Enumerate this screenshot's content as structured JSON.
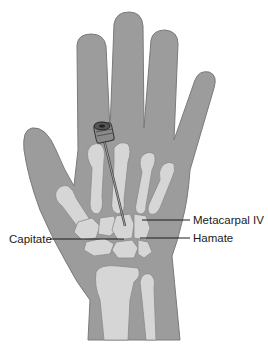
{
  "figure": {
    "colors": {
      "background": "#ffffff",
      "skin": "#9c9c9c",
      "skin_outline": "#7a7a7a",
      "bone": "#d6d6d6",
      "bone_outline": "#8a8a8a",
      "needle": "#444444",
      "leader_line": "#1a1a1a"
    },
    "labels": {
      "metacarpal_iv": "Metacarpal IV",
      "capitate": "Capitate",
      "hamate": "Hamate"
    }
  }
}
